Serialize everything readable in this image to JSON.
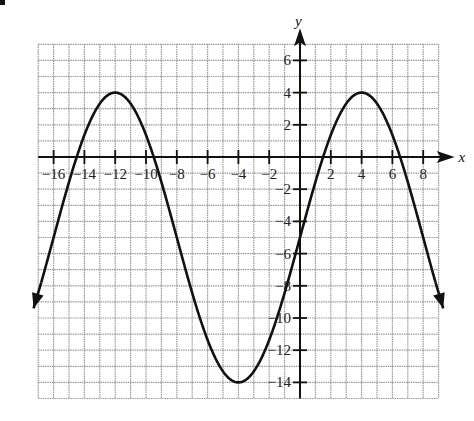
{
  "chart_data": {
    "type": "line",
    "title": "",
    "xlabel": "x",
    "ylabel": "y",
    "xlim": [
      -17,
      9
    ],
    "ylim": [
      -15,
      7
    ],
    "grid": true,
    "x_ticks": [
      -16,
      -14,
      -12,
      -10,
      -8,
      -6,
      -4,
      -2,
      2,
      4,
      6,
      8
    ],
    "y_ticks": [
      6,
      4,
      2,
      -2,
      -4,
      -6,
      -8,
      -10,
      -12,
      -14
    ],
    "function": "y = 9cos(pi(x-4)/8) - 5",
    "key_points": [
      {
        "x": -12,
        "y": 4,
        "label": "maximum"
      },
      {
        "x": -4,
        "y": -14,
        "label": "minimum"
      },
      {
        "x": 4,
        "y": 4,
        "label": "maximum"
      },
      {
        "x": 0,
        "y": -5,
        "label": "y-intercept"
      }
    ],
    "series": [
      {
        "name": "curve",
        "x": [
          -17.3,
          -16,
          -14,
          -12,
          -10,
          -8,
          -6,
          -4,
          -2,
          0,
          2,
          4,
          6,
          8,
          9.3
        ],
        "values": [
          -9.2,
          -5,
          1.4,
          4,
          1.4,
          -5,
          -11.4,
          -14,
          -11.4,
          -5,
          1.4,
          4,
          1.4,
          -5,
          -8.6
        ]
      }
    ],
    "arrows_at_ends": true,
    "colors": {
      "curve": "#111111",
      "grid": "#9a9a9a",
      "axes": "#111111"
    }
  }
}
